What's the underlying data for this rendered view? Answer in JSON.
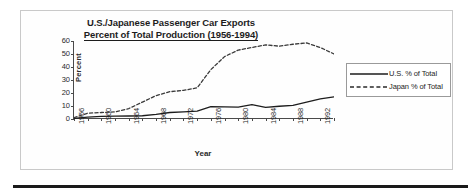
{
  "document": {
    "has_outer_border": true,
    "has_bottom_rule": true
  },
  "chart_data": {
    "type": "line",
    "title": "U.S./Japanese Passenger Car Exports",
    "subtitle": "Percent of Total Production (1956-1994)",
    "xlabel": "Year",
    "ylabel": "Percent",
    "ylim": [
      0,
      60
    ],
    "yticks": [
      0,
      10,
      20,
      30,
      40,
      50,
      60
    ],
    "ytick_labels": [
      "0",
      "10",
      "20",
      "30",
      "40",
      "50",
      "60"
    ],
    "xlim": [
      1956,
      1994
    ],
    "xtick_labels": [
      "1956",
      "1960",
      "1964",
      "1968",
      "1972",
      "1976",
      "1980",
      "1984",
      "1988",
      "1992"
    ],
    "xticks": [
      1956,
      1960,
      1964,
      1968,
      1972,
      1976,
      1980,
      1984,
      1988,
      1992
    ],
    "grid": false,
    "legend_position": "right",
    "x": [
      1956,
      1958,
      1960,
      1962,
      1964,
      1966,
      1968,
      1970,
      1972,
      1974,
      1976,
      1978,
      1980,
      1982,
      1984,
      1986,
      1988,
      1990,
      1992,
      1994
    ],
    "series": [
      {
        "name": "U.S. % of Total",
        "style": "solid",
        "color": "#1d1d1d",
        "values": [
          0.5,
          1.5,
          2.0,
          2.2,
          2.3,
          2.5,
          3.5,
          5.0,
          5.5,
          6.0,
          9.5,
          9.3,
          9.2,
          11.0,
          9.0,
          9.8,
          10.5,
          13.0,
          15.5,
          17.0
        ]
      },
      {
        "name": "Japan % of Total",
        "style": "dashed",
        "color": "#3a3a3a",
        "values": [
          1.0,
          4.5,
          5.0,
          5.5,
          8.0,
          13.0,
          18.0,
          21.0,
          22.0,
          24.0,
          38.0,
          48.0,
          53.0,
          55.0,
          57.0,
          56.0,
          57.5,
          58.5,
          55.0,
          50.0
        ]
      }
    ]
  },
  "legend": {
    "items": [
      {
        "label": "U.S. % of Total",
        "style": "solid"
      },
      {
        "label": "Japan % of Total",
        "style": "dashed"
      }
    ]
  }
}
